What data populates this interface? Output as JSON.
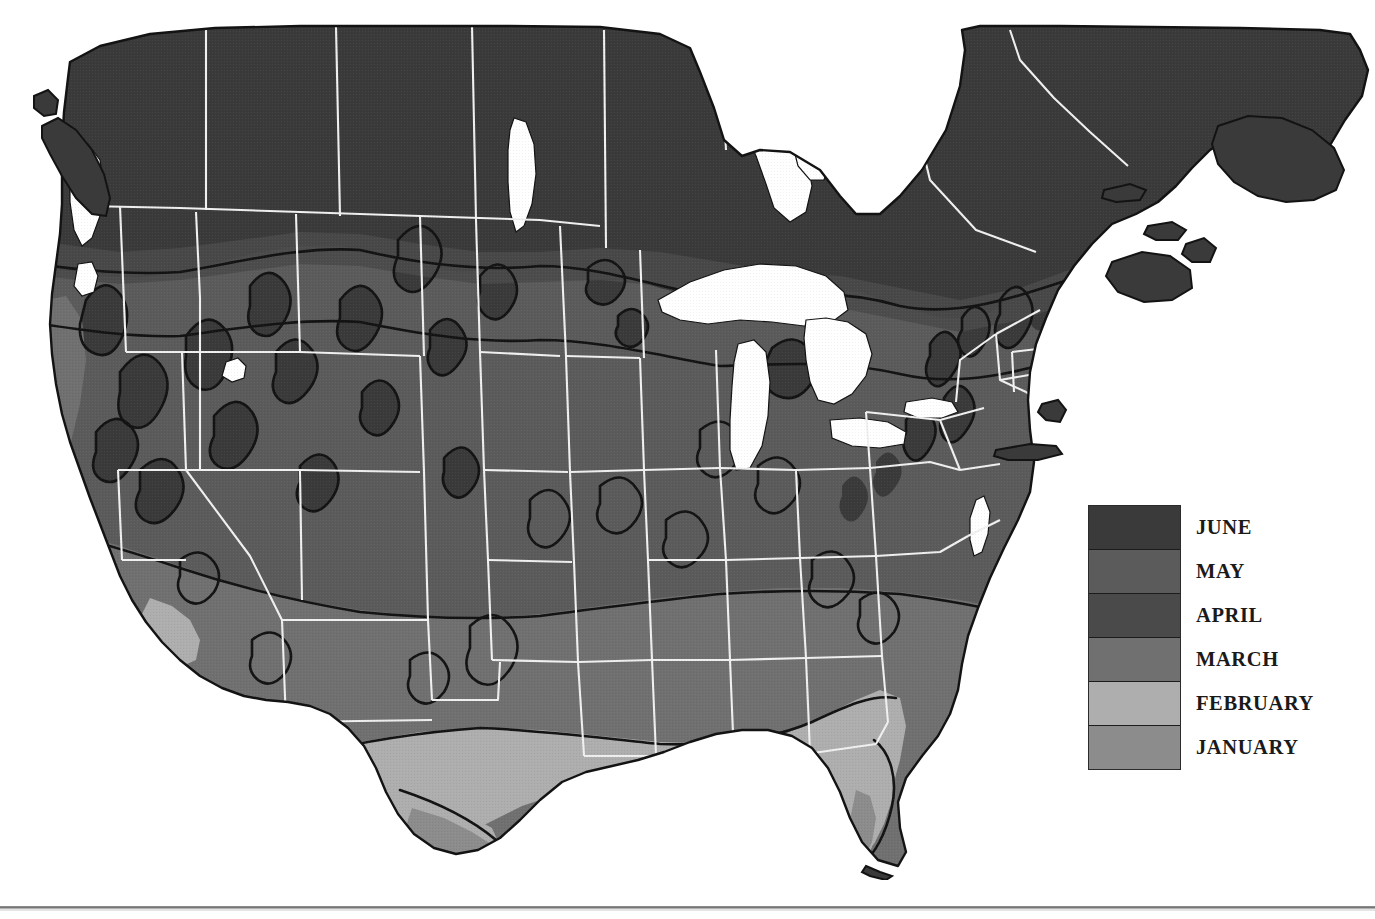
{
  "figure": {
    "kind": "thematic-choropleth-map",
    "region": "North America (United States and southern Canada)",
    "background_color": "#ffffff",
    "water_color": "#ffffff",
    "outline_color": "#1a1a1a",
    "state_border_color": "#f2f2f2"
  },
  "legend": {
    "name": "month-legend",
    "orientation": "vertical",
    "order": "darkest-top-to-lightest-bottom",
    "items": [
      {
        "label": "JUNE",
        "color": "#3a3a3a"
      },
      {
        "label": "MAY",
        "color": "#5b5b5b"
      },
      {
        "label": "APRIL",
        "color": "#4a4a4a"
      },
      {
        "label": "MARCH",
        "color": "#707070"
      },
      {
        "label": "FEBRUARY",
        "color": "#aeaeae"
      },
      {
        "label": "JANUARY",
        "color": "#8c8c8c"
      }
    ]
  },
  "map_zones": {
    "june": "#3a3a3a",
    "may": "#5b5b5b",
    "april": "#4a4a4a",
    "march": "#707070",
    "february": "#aeaeae",
    "january": "#8c8c8c"
  }
}
